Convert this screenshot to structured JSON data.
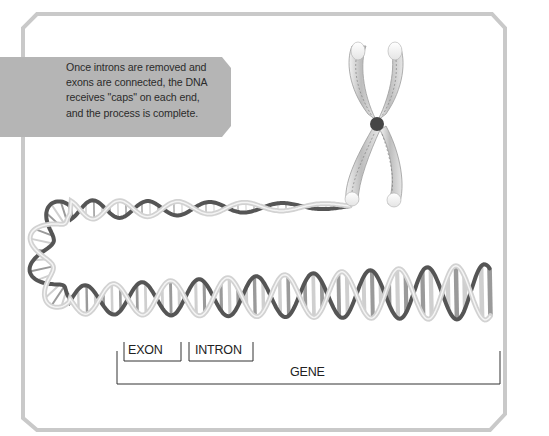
{
  "callout": {
    "text_lines": [
      "Once introns are removed and",
      "exons are connected, the DNA",
      "receives \"caps\" on each end,",
      "and the process is complete."
    ]
  },
  "labels": {
    "exon": "EXON",
    "intron": "INTRON",
    "gene": "GENE"
  },
  "colors": {
    "frame": "#c9c9c9",
    "callout_bg": "#b4b4b4",
    "callout_text": "#2b2b2b",
    "strand_light": "#d2d2d2",
    "strand_dark": "#555555",
    "centromere": "#444444",
    "bracket": "#333333"
  }
}
